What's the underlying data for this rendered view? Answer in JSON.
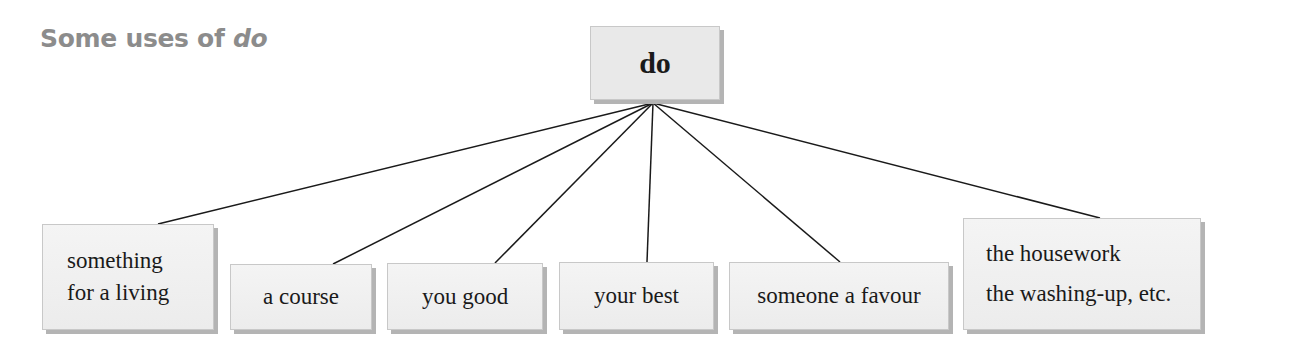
{
  "title": {
    "prefix": "Some uses of ",
    "keyword": "do"
  },
  "root": {
    "label": "do"
  },
  "branches": [
    {
      "lines": [
        "something",
        "for a living"
      ]
    },
    {
      "lines": [
        "a course"
      ]
    },
    {
      "lines": [
        "you good"
      ]
    },
    {
      "lines": [
        "your best"
      ]
    },
    {
      "lines": [
        "someone a favour"
      ]
    },
    {
      "lines": [
        "the housework",
        "the washing-up, etc."
      ]
    }
  ],
  "colors": {
    "title": "#8c8c8c",
    "box_fill": "#eeeeee",
    "box_shadow": "#b4b4b4",
    "line": "#1a1a1a"
  }
}
